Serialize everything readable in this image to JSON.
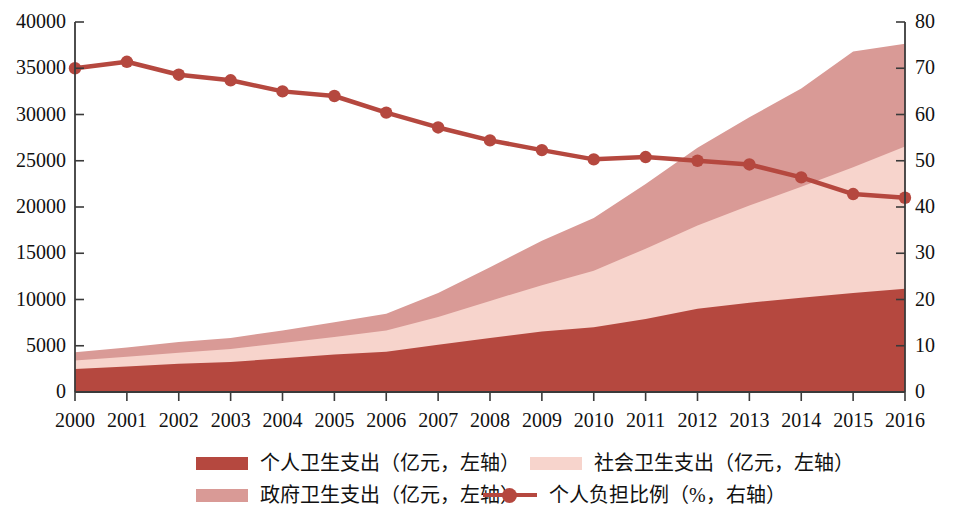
{
  "chart_data": {
    "type": "area",
    "title": "",
    "subtitle": "",
    "xlabel": "",
    "ylabel": "",
    "grid": false,
    "legend_position": "bottom",
    "categories": [
      "2000",
      "2001",
      "2002",
      "2003",
      "2004",
      "2005",
      "2006",
      "2007",
      "2008",
      "2009",
      "2010",
      "2011",
      "2012",
      "2013",
      "2014",
      "2015",
      "2016"
    ],
    "left_axis": {
      "label": "亿元",
      "ylim": [
        0,
        40000
      ],
      "ticks": [
        "0",
        "5000",
        "10000",
        "15000",
        "20000",
        "25000",
        "30000",
        "35000",
        "40000"
      ],
      "tick_values": [
        0,
        5000,
        10000,
        15000,
        20000,
        25000,
        30000,
        35000,
        40000
      ]
    },
    "right_axis": {
      "label": "%",
      "ylim": [
        0,
        80
      ],
      "ticks": [
        "0",
        "10",
        "20",
        "30",
        "40",
        "50",
        "60",
        "70",
        "80"
      ],
      "tick_values": [
        0,
        10,
        20,
        30,
        40,
        50,
        60,
        70,
        80
      ]
    },
    "stacked": true,
    "series": [
      {
        "name": "个人卫生支出（亿元，左轴）",
        "key": "personal_expenditure",
        "axis": "left",
        "kind": "area",
        "color": "#B5483F",
        "values": [
          2500,
          2750,
          3050,
          3250,
          3650,
          4050,
          4350,
          5100,
          5850,
          6550,
          7000,
          7900,
          9000,
          9650,
          10200,
          10700,
          11150
        ]
      },
      {
        "name": "社会卫生支出（亿元，左轴）",
        "key": "social_expenditure",
        "axis": "left",
        "kind": "area",
        "color": "#F7D4CC",
        "values": [
          900,
          1050,
          1200,
          1400,
          1650,
          1900,
          2300,
          3000,
          4000,
          5000,
          6100,
          7600,
          9000,
          10500,
          12000,
          13600,
          15400
        ]
      },
      {
        "name": "政府卫生支出（亿元，左轴）",
        "key": "government_expenditure",
        "axis": "left",
        "kind": "area",
        "color": "#D99A96",
        "values": [
          900,
          1000,
          1150,
          1200,
          1350,
          1600,
          1800,
          2600,
          3650,
          4800,
          5700,
          7000,
          8400,
          9550,
          10600,
          12500,
          11100
        ]
      },
      {
        "name": "个人负担比例（%，右轴）",
        "key": "personal_burden_ratio",
        "axis": "right",
        "kind": "line",
        "color": "#B5483F",
        "values": [
          59.0,
          60.0,
          57.7,
          56.0,
          53.6,
          52.2,
          49.3,
          44.1,
          40.4,
          37.5,
          35.3,
          34.8,
          34.3,
          33.9,
          32.0,
          29.3,
          28.8
        ]
      }
    ],
    "line_plot_percent": [
      70.0,
      71.4,
      68.6,
      67.4,
      65.0,
      64.0,
      60.4,
      57.2,
      54.4,
      52.3,
      50.3,
      50.8,
      50.0,
      49.2,
      46.4,
      42.8,
      42.0
    ]
  },
  "axes": {
    "left_ticks": [
      "40000",
      "35000",
      "30000",
      "25000",
      "20000",
      "15000",
      "10000",
      "5000",
      "0"
    ],
    "right_ticks": [
      "80",
      "70",
      "60",
      "50",
      "40",
      "30",
      "20",
      "10",
      "0"
    ],
    "x_ticks": [
      "2000",
      "2001",
      "2002",
      "2003",
      "2004",
      "2005",
      "2006",
      "2007",
      "2008",
      "2009",
      "2010",
      "2011",
      "2012",
      "2013",
      "2014",
      "2015",
      "2016"
    ]
  },
  "legend": {
    "items": [
      {
        "label": "个人卫生支出（亿元，左轴）",
        "color": "#B5483F",
        "marker": "swatch"
      },
      {
        "label": "社会卫生支出（亿元，左轴）",
        "color": "#F7D4CC",
        "marker": "swatch"
      },
      {
        "label": "政府卫生支出（亿元，左轴）",
        "color": "#D99A96",
        "marker": "swatch"
      },
      {
        "label": "个人负担比例（%，右轴）",
        "color": "#B5483F",
        "marker": "line-dot"
      }
    ]
  },
  "colors": {
    "personal": "#B5483F",
    "social": "#F7D4CC",
    "government": "#D99A96",
    "axis": "#3a3a3a",
    "background": "#ffffff"
  }
}
